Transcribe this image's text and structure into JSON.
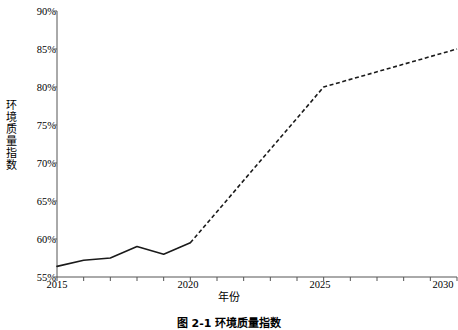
{
  "chart_data": {
    "type": "line",
    "title": "",
    "xlabel": "年份",
    "ylabel": "环境质量指数",
    "xlim": [
      2015,
      2030
    ],
    "ylim": [
      55,
      90
    ],
    "ytick_labels": [
      "90%",
      "85%",
      "80%",
      "75%",
      "70%",
      "65%",
      "60%",
      "55%"
    ],
    "ytick_values": [
      90,
      85,
      80,
      75,
      70,
      65,
      60,
      55
    ],
    "xtick_labels": [
      "2015",
      "2020",
      "2025",
      "2030"
    ],
    "xtick_values": [
      2015,
      2020,
      2025,
      2030
    ],
    "grid": false,
    "legend": "none",
    "line_color": "#1a1a1a",
    "series": [
      {
        "name": "历史值",
        "style": "solid",
        "x": [
          2015,
          2016,
          2017,
          2018,
          2019,
          2020
        ],
        "values": [
          56.4,
          57.2,
          57.5,
          59.0,
          58.0,
          59.5
        ]
      },
      {
        "name": "预测值",
        "style": "dashed",
        "x": [
          2020,
          2025,
          2030
        ],
        "values": [
          59.5,
          80.0,
          85.0
        ]
      }
    ]
  },
  "caption": {
    "text": "图 2-1  环境质量指数"
  }
}
